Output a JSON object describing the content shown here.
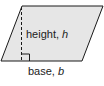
{
  "diagram": {
    "shape": "parallelogram",
    "fill_color": "#e6e6e6",
    "stroke_color": "#1a1a1a",
    "height_label": {
      "text": "height, ",
      "variable": "h"
    },
    "base_label": {
      "text": "base, ",
      "variable": "b"
    }
  }
}
